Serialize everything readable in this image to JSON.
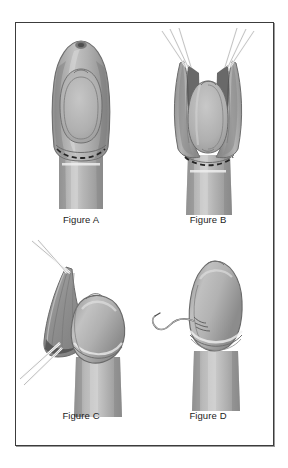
{
  "plate": {
    "type": "medical-illustration-plate",
    "panel_count": 4,
    "border_color": "#3c3c3c",
    "background_color": "#ffffff"
  },
  "palette": {
    "tissue_mid": "#a6a6a6",
    "tissue_light": "#bfbfbf",
    "tissue_lighter": "#cfcfcf",
    "tissue_dark": "#8d8d8d",
    "tissue_darker": "#6e6e6e",
    "shadow_deep": "#4a4a4a",
    "outline": "#5a5a5a",
    "outline_soft": "#7d7d7d",
    "highlight": "#e6e6e6",
    "instrument": "#fbfbfb",
    "instrument_edge": "#6d6d6d",
    "dashed_line": "#2a2a2a",
    "aperture": "#6a6a6a",
    "caption_color": "#1c1c1c"
  },
  "panels": [
    {
      "id": "a",
      "caption": "Figure A",
      "view": "anterior",
      "description": "Intact glans with apical meatus, concentric corona outline and dashed incision line marked across the shaft below the corona."
    },
    {
      "id": "b",
      "caption": "Figure B",
      "view": "anterior",
      "description": "Tissue opened and retracted laterally with traction sutures held on both sides, exposing the inner surface; dashed incision line visible at the base."
    },
    {
      "id": "c",
      "caption": "Figure C",
      "view": "lateral",
      "description": "Lateral view with the retracted tissue flap drawn to one side by two sets of instruments while the glans remains exposed."
    },
    {
      "id": "d",
      "caption": "Figure D",
      "view": "anterior",
      "description": "Final approximated result with a single curved suture and trailing thread placed at the coronal margin."
    }
  ]
}
